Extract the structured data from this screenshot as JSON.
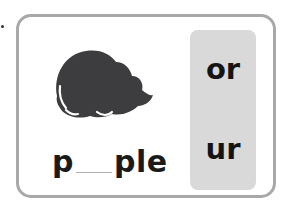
{
  "worksheet": {
    "picture": {
      "icon": "purple-blob-icon",
      "fill_color": "#3d3d3f",
      "highlight_color": "#ffffff"
    },
    "word": {
      "prefix": "p",
      "blank": "__",
      "suffix": "ple"
    },
    "options": [
      {
        "label": "or"
      },
      {
        "label": "ur"
      }
    ],
    "colors": {
      "card_border": "#a8a8a8",
      "panel_background": "#d9d9d9",
      "text": "#1a1a1a"
    }
  }
}
